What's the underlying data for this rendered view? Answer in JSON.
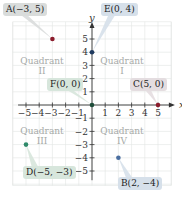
{
  "diagram": {
    "title": "",
    "axes": {
      "x_label": "x",
      "y_label": "y",
      "x_ticks": [
        "-5",
        "-4",
        "-3",
        "-2",
        "-1",
        "1",
        "2",
        "3",
        "4",
        "5"
      ],
      "y_ticks": [
        "5",
        "4",
        "3",
        "2",
        "1",
        "-1",
        "-2",
        "-3",
        "-4",
        "-5"
      ],
      "range": [
        -5,
        5
      ]
    },
    "quadrants": [
      {
        "name": "Quadrant",
        "numeral": "II",
        "x": 42,
        "y": 56
      },
      {
        "name": "Quadrant",
        "numeral": "I",
        "x": 122,
        "y": 56
      },
      {
        "name": "Quadrant",
        "numeral": "III",
        "x": 42,
        "y": 126
      },
      {
        "name": "Quadrant",
        "numeral": "IV",
        "x": 122,
        "y": 126
      }
    ],
    "points": [
      {
        "id": "A",
        "label": "A(−3, 5)",
        "x": -3,
        "y": 5,
        "color": "#8b1c2c",
        "box_color": "#d9dcdb",
        "box_x": 3,
        "box_y": 3
      },
      {
        "id": "E",
        "label": "E(0, 4)",
        "x": 0,
        "y": 4,
        "color": "#1f3a5f",
        "box_color": "#d6e0ea",
        "box_x": 101,
        "box_y": 3
      },
      {
        "id": "F",
        "label": "F(0, 0)",
        "x": 0,
        "y": 0,
        "color": "#1e4d3a",
        "box_color": "#d7e6dc",
        "box_x": 47,
        "box_y": 78
      },
      {
        "id": "C",
        "label": "C(5, 0)",
        "x": 5,
        "y": 0,
        "color": "#8b1c2c",
        "box_color": "#e4dde0",
        "box_x": 130,
        "box_y": 78
      },
      {
        "id": "D",
        "label": "D(−5, −3)",
        "x": -5,
        "y": -3,
        "color": "#2f8a6a",
        "box_color": "#d7e6dc",
        "box_x": 23,
        "box_y": 166
      },
      {
        "id": "B",
        "label": "B(2, −4)",
        "x": 2,
        "y": -4,
        "color": "#4a6ea0",
        "box_color": "#d6e0ea",
        "box_x": 118,
        "box_y": 177
      }
    ]
  }
}
